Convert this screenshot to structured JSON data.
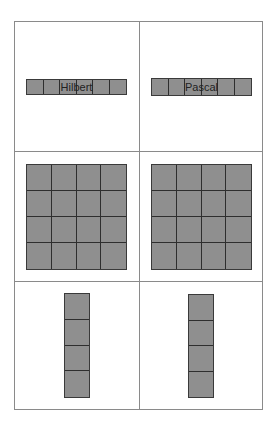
{
  "figure": {
    "panels": [
      {
        "id": "hilbert-1d",
        "label": "Hilbert",
        "rows": 1,
        "cols": 6
      },
      {
        "id": "pascal-1d",
        "label": "Pascal",
        "rows": 1,
        "cols": 6
      },
      {
        "id": "hilbert-2d",
        "label": "",
        "rows": 4,
        "cols": 4
      },
      {
        "id": "pascal-2d",
        "label": "",
        "rows": 4,
        "cols": 4
      },
      {
        "id": "hilbert-col",
        "label": "",
        "rows": 4,
        "cols": 1
      },
      {
        "id": "pascal-col",
        "label": "",
        "rows": 4,
        "cols": 1
      }
    ],
    "colors": {
      "fill": "#8f8f8f",
      "grid_line": "#2e2e2e",
      "frame": "#8a8a8a"
    }
  }
}
